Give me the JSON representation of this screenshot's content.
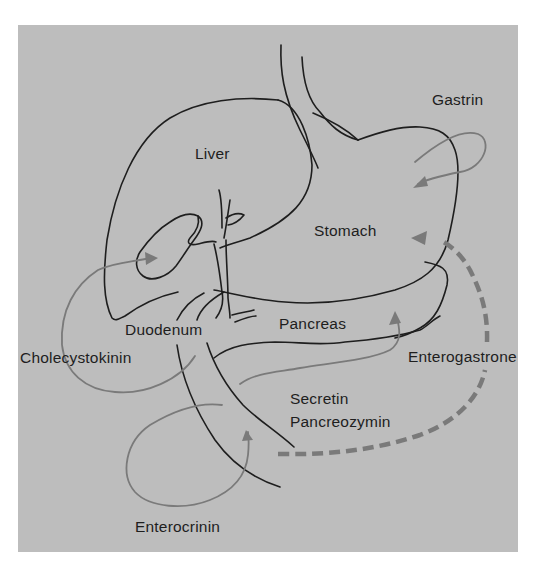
{
  "figure": {
    "type": "anatomical-diagram",
    "colors": {
      "background": "#ffffff",
      "panel": "#bdbdbd",
      "organ_outline": "#1e1e1e",
      "hormone_pathway": "#7a7a7a",
      "label_text": "#1e1e1e"
    }
  },
  "organs": {
    "liver": "Liver",
    "stomach": "Stomach",
    "duodenum": "Duodenum",
    "pancreas": "Pancreas"
  },
  "hormones": {
    "gastrin": "Gastrin",
    "cholecystokinin": "Cholecystokinin",
    "enterogastrone": "Enterogastrone",
    "secretin": "Secretin",
    "pancreozymin": "Pancreozymin",
    "enterocrinin": "Enterocrinin"
  },
  "pathways": [
    {
      "hormone": "Gastrin",
      "from": "Stomach",
      "to": "Stomach",
      "style": "solid"
    },
    {
      "hormone": "Cholecystokinin",
      "from": "Duodenum",
      "to": "Gallbladder",
      "style": "solid"
    },
    {
      "hormone": "Secretin / Pancreozymin",
      "from": "Duodenum",
      "to": "Pancreas",
      "style": "solid"
    },
    {
      "hormone": "Enterocrinin",
      "from": "Small intestine",
      "to": "Small intestine",
      "style": "solid"
    },
    {
      "hormone": "Enterogastrone",
      "from": "Duodenum",
      "to": "Stomach",
      "style": "dashed"
    }
  ]
}
